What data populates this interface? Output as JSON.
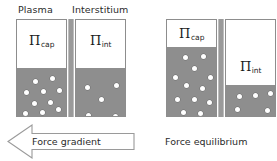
{
  "figure": {
    "colors": {
      "solution_fill": "#8e8e8e",
      "particle": "#ffffff",
      "chamber_border": "#8d8d8d",
      "membrane": "#9a9a9a",
      "text": "#2b2b2b"
    }
  },
  "left_group": {
    "headers": {
      "plasma": "Plasma",
      "interstitium": "Interstitium"
    },
    "capillary": {
      "symbol": "Π",
      "subscript": "cap",
      "fill_percent": 50,
      "particle_count": 12,
      "particles": [
        {
          "x": 16,
          "y": 10
        },
        {
          "x": 33,
          "y": 7
        },
        {
          "x": 7,
          "y": 21
        },
        {
          "x": 24,
          "y": 20
        },
        {
          "x": 40,
          "y": 19
        },
        {
          "x": 15,
          "y": 32
        },
        {
          "x": 31,
          "y": 31
        },
        {
          "x": 6,
          "y": 42
        },
        {
          "x": 23,
          "y": 41
        },
        {
          "x": 39,
          "y": 38
        },
        {
          "x": 13,
          "y": 52
        },
        {
          "x": 31,
          "y": 52
        }
      ]
    },
    "interstitium": {
      "symbol": "Π",
      "subscript": "int",
      "fill_percent": 50,
      "particle_count": 5,
      "particles": [
        {
          "x": 9,
          "y": 16
        },
        {
          "x": 38,
          "y": 14
        },
        {
          "x": 23,
          "y": 28
        },
        {
          "x": 10,
          "y": 44
        },
        {
          "x": 37,
          "y": 45
        }
      ]
    },
    "arrow": {
      "label": "Force gradient",
      "direction": "left"
    }
  },
  "right_group": {
    "capillary": {
      "symbol": "Π",
      "subscript": "cap",
      "fill_percent": 72,
      "particle_count": 12,
      "particles": [
        {
          "x": 16,
          "y": 8
        },
        {
          "x": 34,
          "y": 7
        },
        {
          "x": 25,
          "y": 19
        },
        {
          "x": 6,
          "y": 28
        },
        {
          "x": 41,
          "y": 28
        },
        {
          "x": 17,
          "y": 36
        },
        {
          "x": 33,
          "y": 39
        },
        {
          "x": 8,
          "y": 50
        },
        {
          "x": 25,
          "y": 50
        },
        {
          "x": 40,
          "y": 53
        },
        {
          "x": 14,
          "y": 63
        },
        {
          "x": 31,
          "y": 64
        }
      ]
    },
    "interstitium": {
      "symbol": "Π",
      "subscript": "int",
      "fill_percent": 32,
      "particle_count": 5,
      "particles": [
        {
          "x": 11,
          "y": 7
        },
        {
          "x": 27,
          "y": 6
        },
        {
          "x": 42,
          "y": 4
        },
        {
          "x": 9,
          "y": 20
        },
        {
          "x": 39,
          "y": 21
        }
      ]
    },
    "caption": "Force equilibrium"
  }
}
